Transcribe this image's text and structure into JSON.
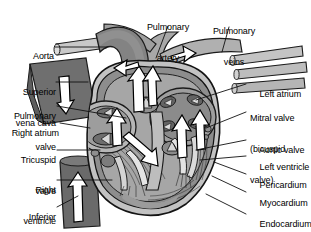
{
  "figure": {
    "style": "grayscale line drawing with blood-flow arrows"
  },
  "palette": {
    "background": "#ffffff",
    "text": "#000000",
    "leader_line": "#111111",
    "outline": "#1b1b1b",
    "deoxygenated_vessel_dark": "#6f6f6f",
    "oxygenated_vessel_light": "#c9c9c9",
    "chamber_mid_gray": "#9a9a9a",
    "chamber_light_gray": "#bdbdbd",
    "myocardium_gray": "#8a8a8a",
    "valve_cusp_light": "#d6d6d6",
    "arrow_fill": "#ffffff",
    "arrow_stroke": "#000000"
  },
  "labels_left": [
    {
      "id": "aorta",
      "text": "Aorta",
      "lines": [
        "Aorta"
      ]
    },
    {
      "id": "superior-vena-cava",
      "text": "Superior vena cava",
      "lines": [
        "Superior",
        "vena cava"
      ]
    },
    {
      "id": "pulmonary-valve",
      "text": "Pulmonary valve",
      "lines": [
        "Pulmonary",
        "valve"
      ]
    },
    {
      "id": "right-atrium",
      "text": "Right atrium",
      "lines": [
        "Right atrium"
      ]
    },
    {
      "id": "tricuspid-valve",
      "text": "Tricuspid valve",
      "lines": [
        "Tricuspid",
        "valve"
      ]
    },
    {
      "id": "right-ventricle",
      "text": "Right ventricle",
      "lines": [
        "Right",
        "ventricle"
      ]
    },
    {
      "id": "inferior-vena-cava",
      "text": "Inferior vena cava",
      "lines": [
        "Inferior",
        "vena cava"
      ]
    }
  ],
  "labels_top": [
    {
      "id": "pulmonary-artery",
      "text": "Pulmonary artery",
      "lines": [
        "Pulmonary",
        "artery"
      ]
    },
    {
      "id": "pulmonary-veins",
      "text": "Pulmonary veins",
      "lines": [
        "Pulmonary",
        "veins"
      ]
    }
  ],
  "labels_right": [
    {
      "id": "left-atrium",
      "text": "Left atrium",
      "lines": [
        "Left atrium"
      ]
    },
    {
      "id": "mitral-valve",
      "text": "Mitral valve (bicuspid valve)",
      "lines": [
        "Mitral valve",
        "(bicuspid",
        "valve)"
      ]
    },
    {
      "id": "aortic-valve",
      "text": "Aortic valve",
      "lines": [
        "Aortic valve"
      ]
    },
    {
      "id": "left-ventricle",
      "text": "Left ventricle",
      "lines": [
        "Left ventricle"
      ]
    },
    {
      "id": "pericardium",
      "text": "Pericardium",
      "lines": [
        "Pericardium"
      ]
    },
    {
      "id": "myocardium",
      "text": "Myocardium",
      "lines": [
        "Myocardium"
      ]
    },
    {
      "id": "endocardium",
      "text": "Endocardium",
      "lines": [
        "Endocardium"
      ]
    }
  ]
}
